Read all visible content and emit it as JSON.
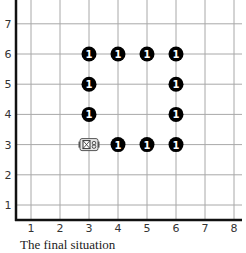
{
  "diagram": {
    "type": "grid-board",
    "x_ticks": [
      "1",
      "2",
      "3",
      "4",
      "5",
      "6",
      "7",
      "8"
    ],
    "y_ticks": [
      "1",
      "2",
      "3",
      "4",
      "5",
      "6",
      "7"
    ],
    "x_range": [
      1,
      8
    ],
    "y_range": [
      1,
      7
    ],
    "pieces": [
      {
        "x": 3,
        "y": 6,
        "label": "1"
      },
      {
        "x": 4,
        "y": 6,
        "label": "1"
      },
      {
        "x": 5,
        "y": 6,
        "label": "1"
      },
      {
        "x": 6,
        "y": 6,
        "label": "1"
      },
      {
        "x": 3,
        "y": 5,
        "label": "1"
      },
      {
        "x": 6,
        "y": 5,
        "label": "1"
      },
      {
        "x": 3,
        "y": 4,
        "label": "1"
      },
      {
        "x": 6,
        "y": 4,
        "label": "1"
      },
      {
        "x": 4,
        "y": 3,
        "label": "1"
      },
      {
        "x": 5,
        "y": 3,
        "label": "1"
      },
      {
        "x": 6,
        "y": 3,
        "label": "1"
      }
    ],
    "robot": {
      "x": 3,
      "y": 3,
      "icon": "robot-icon"
    },
    "colors": {
      "piece": "#000000",
      "piece_text": "#ffffff",
      "grid": "#a8a8a8",
      "axis": "#111111",
      "tick_text": "#333333"
    }
  },
  "caption": "The final situation"
}
